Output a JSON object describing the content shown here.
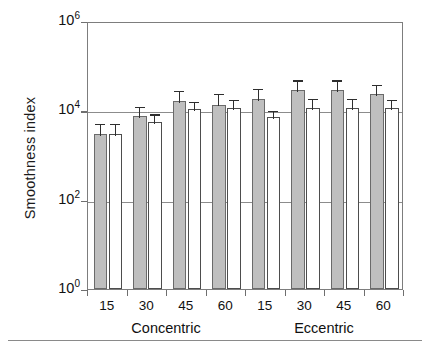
{
  "chart_data": {
    "type": "bar",
    "title": "",
    "xlabel": "",
    "ylabel": "Smoothness index",
    "yscale": "log",
    "ylim": [
      1,
      1000000
    ],
    "ytick_labels": [
      "10⁰",
      "10²",
      "10⁴",
      "10⁶"
    ],
    "ytick_values": [
      1,
      100,
      10000,
      1000000
    ],
    "ytick_base": "10",
    "ytick_exponents": [
      "0",
      "2",
      "4",
      "6"
    ],
    "grid": true,
    "grid_lines_at": [
      100,
      10000
    ],
    "legend": [],
    "legend_position": "none",
    "categories": [
      "15",
      "30",
      "45",
      "60",
      "15",
      "30",
      "45",
      "60"
    ],
    "groups": [
      {
        "label": "Concentric",
        "categories": [
          "15",
          "30",
          "45",
          "60"
        ]
      },
      {
        "label": "Eccentric",
        "categories": [
          "15",
          "30",
          "45",
          "60"
        ]
      }
    ],
    "series": [
      {
        "name": "filled",
        "fill": "#bfbfbf",
        "values": [
          3000,
          7500,
          16000,
          13500,
          18000,
          28000,
          28000,
          23000
        ],
        "errors_upper": [
          5500,
          13000,
          30000,
          26000,
          33000,
          52000,
          52000,
          42000
        ],
        "errors_lower": [
          3000,
          7500,
          16000,
          13500,
          18000,
          28000,
          28000,
          23000
        ]
      },
      {
        "name": "open",
        "fill": "#ffffff",
        "values": [
          3000,
          5500,
          10500,
          11500,
          7000,
          11500,
          11500,
          11500
        ],
        "errors_upper": [
          5500,
          9000,
          17000,
          19000,
          11000,
          20000,
          20000,
          19000
        ],
        "errors_lower": [
          3000,
          5500,
          10500,
          11500,
          7000,
          11500,
          11500,
          11500
        ]
      }
    ]
  },
  "axes": {
    "y_title": "Smoothness index"
  }
}
